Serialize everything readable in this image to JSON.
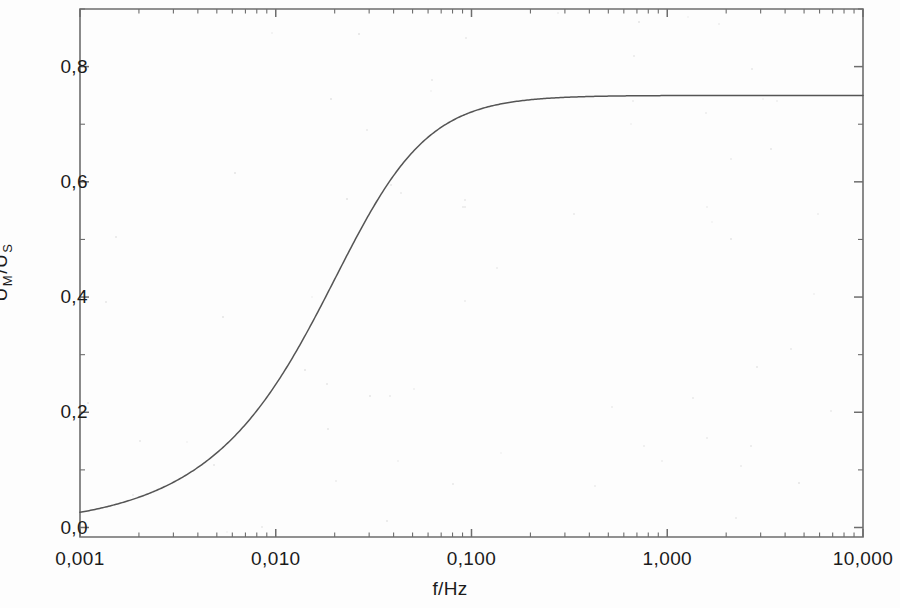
{
  "chart_data": {
    "type": "line",
    "title": "",
    "subtitle": "",
    "xlabel": "f/Hz",
    "ylabel": "U M/U S",
    "ylabel_parts": {
      "base1": "U",
      "sub1": "M",
      "separator": "/U",
      "sub2": "S"
    },
    "xscale": "log",
    "yscale": "linear",
    "xlim": [
      0.001,
      10.0
    ],
    "ylim": [
      -0.0165,
      0.9
    ],
    "grid": false,
    "legend": null,
    "legend_position": "none",
    "xtick_labels": [
      "0,001",
      "0,010",
      "0,100",
      "1,000",
      "10,000"
    ],
    "xtick_values": [
      0.001,
      0.01,
      0.1,
      1.0,
      10.0
    ],
    "ytick_labels": [
      "0,0",
      "0,2",
      "0,4",
      "0,6",
      "0,8"
    ],
    "ytick_values": [
      0.0,
      0.2,
      0.4,
      0.6,
      0.8
    ],
    "y_minor_ticks": [
      0.1,
      0.3,
      0.5,
      0.7,
      0.9
    ],
    "x_minor_ticks_per_decade": 9,
    "line_color": "#555555",
    "axis_color": "#6d6d6d",
    "text_color": "#1b1b1b",
    "series": [
      {
        "name": "U_M/U_S",
        "plateau": 0.75,
        "corner_frequency_hz": 0.0285,
        "x": [
          0.001,
          0.0013,
          0.0018,
          0.0024,
          0.0032,
          0.0042,
          0.0056,
          0.0075,
          0.01,
          0.0133,
          0.0178,
          0.0237,
          0.0316,
          0.0422,
          0.0562,
          0.075,
          0.1,
          0.133,
          0.178,
          0.237,
          0.316,
          0.422,
          0.562,
          0.75,
          1.0,
          1.78,
          3.16,
          5.62,
          10.0
        ],
        "y": [
          0.02,
          0.026,
          0.036,
          0.048,
          0.064,
          0.083,
          0.11,
          0.143,
          0.185,
          0.236,
          0.296,
          0.362,
          0.432,
          0.5,
          0.563,
          0.617,
          0.661,
          0.694,
          0.716,
          0.73,
          0.739,
          0.744,
          0.747,
          0.748,
          0.749,
          0.75,
          0.75,
          0.75,
          0.75
        ]
      }
    ],
    "annotations": []
  },
  "figure": {
    "plot_left_px": 80,
    "plot_right_px": 863,
    "plot_top_px": 9,
    "plot_bottom_px": 537
  }
}
